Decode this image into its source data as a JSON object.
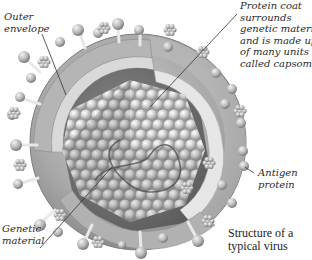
{
  "diagram": {
    "title": "Structure of a typical virus",
    "caption_lines": [
      "Structure of a",
      "typical virus"
    ],
    "labels": {
      "outer_envelope": [
        "Outer",
        "envelope"
      ],
      "protein_coat": [
        "Protein coat",
        "surrounds",
        "genetic material",
        "and is made up",
        "of many units",
        "called capsomers"
      ],
      "genetic_material": [
        "Genetic",
        "material"
      ],
      "antigen_protein": [
        "Antigen",
        "protein"
      ]
    },
    "parts": [
      {
        "name": "Outer envelope",
        "description": "Outer lipid envelope of the virus"
      },
      {
        "name": "Protein coat",
        "description": "Surrounds genetic material and is made up of many units called capsomers"
      },
      {
        "name": "Genetic material",
        "description": "Viral nucleic acid inside the protein coat"
      },
      {
        "name": "Antigen protein",
        "description": "Surface spikes projecting from the envelope"
      }
    ],
    "colors": {
      "background": "#ffffff",
      "envelope": "#9a9a9a",
      "envelope_inner": "#cfcfcf",
      "capsomer": "#d8d8d8",
      "text": "#2a2a2a",
      "leader_line": "#333333"
    }
  }
}
